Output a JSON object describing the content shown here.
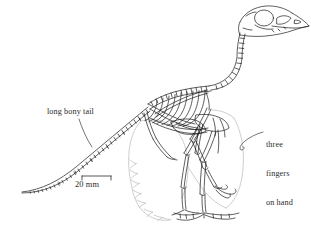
{
  "figure": {
    "type": "scientific-line-drawing",
    "background_color": "#ffffff",
    "ink_color": "#1a1a1a",
    "feather_outline_color": "#b9b9be",
    "text_color": "#2b2b2b"
  },
  "annotations": {
    "tail": {
      "name": "long-bony-tail",
      "text": "long bony tail",
      "leader": "diagonal line from text down-right to the tail vertebrae"
    },
    "hand": {
      "name": "three-fingers-on-hand",
      "line1": "three",
      "line2": "fingers",
      "line3": "on hand",
      "leader": "short curved line from text left to the clawed hand"
    }
  },
  "scale_bar": {
    "name": "scale-bar",
    "label": "20 mm",
    "length_px": 29,
    "value": 20,
    "unit": "mm",
    "style": "bracket with downward end ticks"
  },
  "skeleton_parts": [
    "skull",
    "orbit",
    "beak",
    "cervical-vertebrae",
    "dorsal-vertebrae",
    "ribcage",
    "sternum",
    "scapula",
    "forelimb",
    "hand-with-three-fingers",
    "pelvis",
    "femur",
    "tibia",
    "tarsometatarsus",
    "foot",
    "caudal-vertebrae-tail"
  ]
}
